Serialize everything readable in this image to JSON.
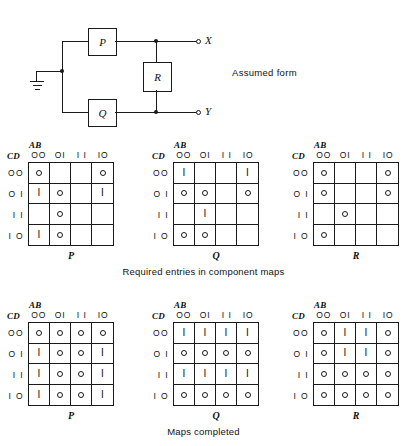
{
  "figure": {
    "diagram": {
      "title": "Assumed form",
      "boxes": [
        {
          "name": "P",
          "label": "P"
        },
        {
          "name": "Q",
          "label": "Q"
        },
        {
          "name": "R",
          "label": "R"
        }
      ],
      "terminals": [
        {
          "name": "X",
          "label": "X"
        },
        {
          "name": "Y",
          "label": "Y"
        }
      ],
      "ground": "ground-symbol"
    },
    "captions": {
      "row1": "Required entries in component maps",
      "row2": "Maps completed"
    },
    "map_axes": {
      "col_var": "AB",
      "row_var": "CD",
      "col_headers": [
        "OO",
        "OI",
        "I I",
        "IO"
      ],
      "row_headers": [
        "OO",
        "O I",
        "I I",
        "I O"
      ]
    },
    "symbols": {
      "one": "I",
      "zero": "O",
      "blank": ""
    },
    "maps": [
      {
        "name": "map-p-required",
        "label": "P",
        "row": 1,
        "cells": [
          [
            "0",
            "",
            "",
            "0"
          ],
          [
            "1",
            "0",
            "",
            "1"
          ],
          [
            "",
            "0",
            "",
            ""
          ],
          [
            "1",
            "0",
            "",
            ""
          ]
        ]
      },
      {
        "name": "map-q-required",
        "label": "Q",
        "row": 1,
        "cells": [
          [
            "1",
            "",
            "",
            "1"
          ],
          [
            "0",
            "0",
            "",
            "0"
          ],
          [
            "",
            "1",
            "",
            ""
          ],
          [
            "0",
            "0",
            "",
            ""
          ]
        ]
      },
      {
        "name": "map-r-required",
        "label": "R",
        "row": 1,
        "cells": [
          [
            "0",
            "",
            "",
            "0"
          ],
          [
            "0",
            "",
            "",
            "0"
          ],
          [
            "",
            "0",
            "",
            ""
          ],
          [
            "0",
            "",
            "",
            ""
          ]
        ]
      },
      {
        "name": "map-p-completed",
        "label": "P",
        "row": 2,
        "cells": [
          [
            "0",
            "0",
            "0",
            "0"
          ],
          [
            "1",
            "0",
            "0",
            "1"
          ],
          [
            "1",
            "0",
            "0",
            "1"
          ],
          [
            "1",
            "0",
            "0",
            "1"
          ]
        ]
      },
      {
        "name": "map-q-completed",
        "label": "Q",
        "row": 2,
        "cells": [
          [
            "1",
            "1",
            "1",
            "1"
          ],
          [
            "0",
            "0",
            "0",
            "0"
          ],
          [
            "1",
            "1",
            "1",
            "1"
          ],
          [
            "0",
            "0",
            "0",
            "0"
          ]
        ]
      },
      {
        "name": "map-r-completed",
        "label": "R",
        "row": 2,
        "cells": [
          [
            "0",
            "1",
            "1",
            "0"
          ],
          [
            "0",
            "1",
            "1",
            "0"
          ],
          [
            "0",
            "0",
            "0",
            "0"
          ],
          [
            "0",
            "0",
            "0",
            "0"
          ]
        ]
      }
    ]
  }
}
